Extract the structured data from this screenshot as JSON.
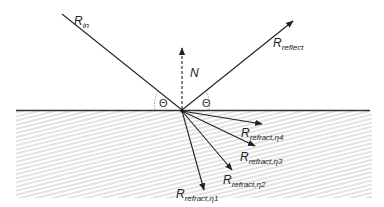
{
  "diagram": {
    "labels": {
      "incident": {
        "main": "R",
        "sub": "in"
      },
      "normal": {
        "main": "N"
      },
      "reflected": {
        "main": "R",
        "sub": "reflect"
      },
      "theta_left": "Θ",
      "theta_right": "Θ",
      "refract": [
        {
          "main": "R",
          "sub": "refract,η1"
        },
        {
          "main": "R",
          "sub": "refract,η2"
        },
        {
          "main": "R",
          "sub": "refract,η3"
        },
        {
          "main": "R",
          "sub": "refract,η4"
        }
      ]
    },
    "colors": {
      "line": "#222222",
      "hatch": "#d9d9d9",
      "surface": "#333333",
      "angle_arc": "#888888"
    }
  }
}
